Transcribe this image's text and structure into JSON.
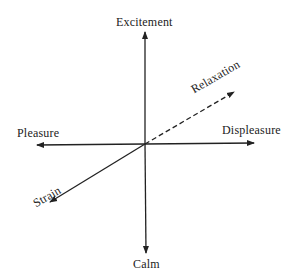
{
  "diagram": {
    "labels": {
      "top": "Excitement",
      "bottom": "Calm",
      "left": "Pleasure",
      "right": "Displeasure",
      "diag_up": "Relaxation",
      "diag_down": "Strain"
    },
    "line_color": "#222222"
  }
}
